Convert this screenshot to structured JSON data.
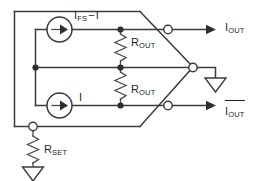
{
  "diagram": {
    "background_color": "#ffffff",
    "line_color": "#3b3b3b",
    "text_color": "#1f1f1f"
  },
  "labels": {
    "source_top": {
      "base": "I",
      "sub": "FS",
      "operator": "−",
      "tail": "I",
      "full": "I_FS − I"
    },
    "source_bottom": {
      "base": "I",
      "full": "I"
    },
    "resistor_top": {
      "base": "R",
      "sub": "OUT",
      "full": "R_OUT"
    },
    "resistor_bottom": {
      "base": "R",
      "sub": "OUT",
      "full": "R_OUT"
    },
    "output_top": {
      "base": "I",
      "sub": "OUT",
      "full": "I_OUT",
      "overbar": false
    },
    "output_bottom": {
      "base": "I",
      "sub": "OUT",
      "full": "I_OUT (complement)",
      "overbar": true
    },
    "resistor_set": {
      "base": "R",
      "sub": "SET",
      "full": "R_SET"
    }
  },
  "components": {
    "current_source_top": "current-source",
    "current_source_bottom": "current-source",
    "resistor_top": "resistor",
    "resistor_bottom": "resistor",
    "resistor_set": "resistor",
    "ground_right": "ground",
    "ground_bottom": "ground"
  },
  "terminals": {
    "count": 4,
    "names": [
      "terminal-output-top",
      "terminal-apex",
      "terminal-output-bottom",
      "terminal-rset"
    ]
  }
}
